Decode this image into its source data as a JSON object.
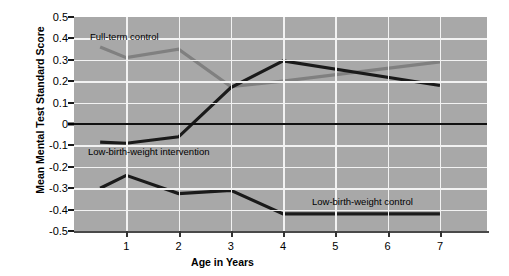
{
  "chart_data": {
    "type": "line",
    "title": "",
    "xlabel": "Age in Years",
    "ylabel": "Mean Mental Test Standard Score",
    "xlim": [
      0,
      7.9
    ],
    "ylim": [
      -0.5,
      0.5
    ],
    "grid": true,
    "legend_position": "inline-annotations",
    "x_ticks": [
      "1",
      "2",
      "3",
      "4",
      "5",
      "6",
      "7"
    ],
    "x_tick_values": [
      1,
      2,
      3,
      4,
      5,
      6,
      7
    ],
    "y_ticks": [
      "0.5",
      "0.4",
      "0.3",
      "0.2",
      "0.1",
      "0",
      "-0.1",
      "-0.2",
      "-0.3",
      "-0.4",
      "-0.5"
    ],
    "y_tick_values": [
      0.5,
      0.4,
      0.3,
      0.2,
      0.1,
      0,
      -0.1,
      -0.2,
      -0.3,
      -0.4,
      -0.5
    ],
    "zero_reference_line": 0,
    "series": [
      {
        "name": "Full-term control",
        "color": "#808080",
        "x": [
          0.5,
          1,
          2,
          3,
          4,
          7
        ],
        "values": [
          0.36,
          0.31,
          0.35,
          0.175,
          0.2,
          0.29
        ]
      },
      {
        "name": "Low-birth-weight intervention",
        "color": "#1a1a1a",
        "x": [
          0.5,
          1,
          2,
          3,
          4,
          7
        ],
        "values": [
          -0.085,
          -0.09,
          -0.06,
          0.17,
          0.295,
          0.18
        ]
      },
      {
        "name": "Low-birth-weight control",
        "color": "#1a1a1a",
        "x": [
          0.5,
          1,
          2,
          3,
          4,
          7
        ],
        "values": [
          -0.3,
          -0.24,
          -0.325,
          -0.31,
          -0.42,
          -0.42
        ]
      }
    ],
    "annotations": [
      {
        "text": "Full-term control",
        "series": "Full-term control"
      },
      {
        "text": "Low-birth-weight intervention",
        "series": "Low-birth-weight intervention"
      },
      {
        "text": "Low-birth-weight control",
        "series": "Low-birth-weight control"
      }
    ],
    "colors": {
      "plot_background": "#a8a8a8",
      "gridline": "#f2f2f2",
      "axis": "#333333",
      "gray_series": "#808080",
      "black_series": "#1a1a1a"
    }
  }
}
